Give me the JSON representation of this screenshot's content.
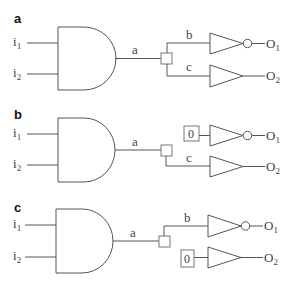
{
  "figure": {
    "panels": [
      {
        "label": "a",
        "inputs": [
          {
            "name": "i",
            "sub": "1"
          },
          {
            "name": "i",
            "sub": "2"
          }
        ],
        "gate_output": "a",
        "branch_top": "b",
        "branch_bottom": "c",
        "constant_top": null,
        "constant_bottom": null,
        "outputs": [
          {
            "name": "O",
            "sub": "1",
            "inverted": true
          },
          {
            "name": "O",
            "sub": "2",
            "inverted": false
          }
        ]
      },
      {
        "label": "b",
        "inputs": [
          {
            "name": "i",
            "sub": "1"
          },
          {
            "name": "i",
            "sub": "2"
          }
        ],
        "gate_output": "a",
        "branch_top": null,
        "branch_bottom": "c",
        "constant_top": "0",
        "constant_bottom": null,
        "outputs": [
          {
            "name": "O",
            "sub": "1",
            "inverted": true
          },
          {
            "name": "O",
            "sub": "2",
            "inverted": false
          }
        ]
      },
      {
        "label": "c",
        "inputs": [
          {
            "name": "i",
            "sub": "1"
          },
          {
            "name": "i",
            "sub": "2"
          }
        ],
        "gate_output": "a",
        "branch_top": "b",
        "branch_bottom": null,
        "constant_top": null,
        "constant_bottom": "0",
        "outputs": [
          {
            "name": "O",
            "sub": "1",
            "inverted": true
          },
          {
            "name": "O",
            "sub": "2",
            "inverted": false
          }
        ]
      }
    ]
  }
}
